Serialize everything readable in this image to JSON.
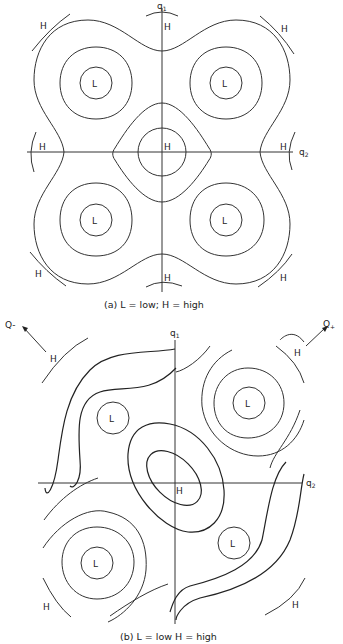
{
  "panel_a": {
    "caption": "(a) L = low; H = high",
    "axis_q1": "q",
    "axis_q1_sub": "1",
    "axis_q2": "q",
    "axis_q2_sub": "2",
    "low_label": "L",
    "high_label": "H"
  },
  "panel_b": {
    "caption": "(b) L = low H = high",
    "axis_q1": "q",
    "axis_q1_sub": "1",
    "axis_q2": "q",
    "axis_q2_sub": "2",
    "low_label": "L",
    "high_label": "H",
    "arrow_minus": "Q-",
    "arrow_plus": "Q",
    "arrow_plus_sub": "+"
  },
  "colors": {
    "line": "#333333",
    "background": "#ffffff"
  }
}
